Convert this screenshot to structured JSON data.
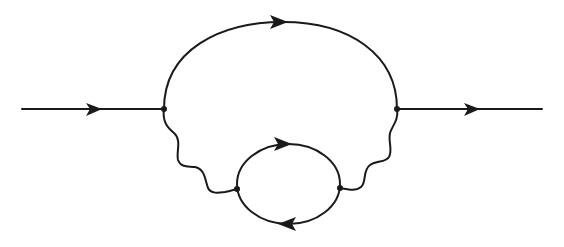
{
  "diagram": {
    "type": "feynman-diagram",
    "colors": {
      "ink": "#1a1a1a",
      "background": "#ffffff"
    },
    "elements": {
      "incoming_fermion": {
        "kind": "fermion-line",
        "direction": "left-to-right"
      },
      "internal_fermion_arc": {
        "kind": "fermion-line",
        "direction": "left-to-right"
      },
      "outgoing_fermion": {
        "kind": "fermion-line",
        "direction": "left-to-right"
      },
      "left_photon": {
        "kind": "wavy-photon-line"
      },
      "right_photon": {
        "kind": "wavy-photon-line"
      },
      "fermion_loop_top": {
        "kind": "fermion-line",
        "direction": "left-to-right"
      },
      "fermion_loop_bottom": {
        "kind": "fermion-line",
        "direction": "right-to-left"
      }
    },
    "vertices": 4
  }
}
